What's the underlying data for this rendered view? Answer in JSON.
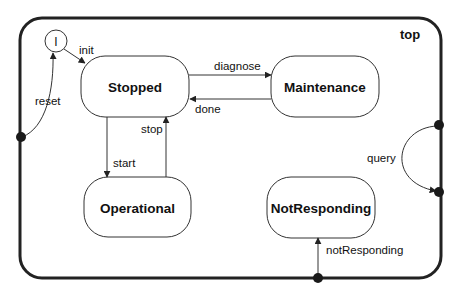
{
  "diagram": {
    "type": "state-machine",
    "container": {
      "label": "top"
    },
    "initial": {
      "label": "I"
    },
    "states": [
      {
        "id": "stopped",
        "label": "Stopped"
      },
      {
        "id": "maintenance",
        "label": "Maintenance"
      },
      {
        "id": "operational",
        "label": "Operational"
      },
      {
        "id": "notresponding",
        "label": "NotResponding"
      }
    ],
    "transitions": [
      {
        "id": "init",
        "label": "init",
        "from": "initial",
        "to": "stopped"
      },
      {
        "id": "diagnose",
        "label": "diagnose",
        "from": "stopped",
        "to": "maintenance"
      },
      {
        "id": "done",
        "label": "done",
        "from": "maintenance",
        "to": "stopped"
      },
      {
        "id": "start",
        "label": "start",
        "from": "stopped",
        "to": "operational"
      },
      {
        "id": "stop",
        "label": "stop",
        "from": "operational",
        "to": "stopped"
      },
      {
        "id": "reset",
        "label": "reset",
        "from": "top-port-left",
        "to": "initial"
      },
      {
        "id": "query",
        "label": "query",
        "from": "top-port-right-upper",
        "to": "top-port-right-lower"
      },
      {
        "id": "notResponding",
        "label": "notResponding",
        "from": "top-port-bottom",
        "to": "notresponding"
      }
    ]
  }
}
